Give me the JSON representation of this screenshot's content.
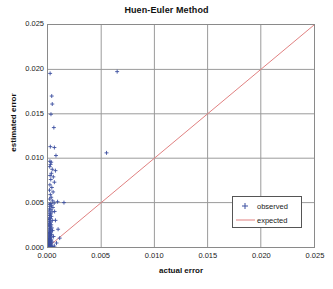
{
  "chart_data": {
    "type": "scatter",
    "title": "Huen-Euler Method",
    "xlabel": "actual error",
    "ylabel": "estimated error",
    "xlim": [
      0.0,
      0.025
    ],
    "ylim": [
      0.0,
      0.025
    ],
    "grid": true,
    "legend_position": "lower-right",
    "xticks": [
      "0.000",
      "0.005",
      "0.010",
      "0.015",
      "0.020",
      "0.025"
    ],
    "yticks": [
      "0.000",
      "0.005",
      "0.010",
      "0.015",
      "0.020",
      "0.025"
    ],
    "xtick_values": [
      0.0,
      0.005,
      0.01,
      0.015,
      0.02,
      0.025
    ],
    "ytick_values": [
      0.0,
      0.005,
      0.01,
      0.015,
      0.02,
      0.025
    ],
    "colors": {
      "observed": "#3b4fa0",
      "expected": "#e08080",
      "grid": "#9a9a9a",
      "frame": "#8a8a8a",
      "background": "#ffffff"
    },
    "series": [
      {
        "name": "observed",
        "type": "scatter",
        "marker": "plus",
        "color": "#3b4fa0",
        "points": [
          [
            0.0002,
            0.01955
          ],
          [
            0.00035,
            0.017
          ],
          [
            0.0004,
            0.0161
          ],
          [
            0.00028,
            0.01495
          ],
          [
            0.00055,
            0.01345
          ],
          [
            0.00022,
            0.0113
          ],
          [
            0.0006,
            0.0112
          ],
          [
            0.00075,
            0.0103
          ],
          [
            0.0055,
            0.0106
          ],
          [
            0.0065,
            0.01975
          ],
          [
            0.00018,
            0.00965
          ],
          [
            0.0003,
            0.00955
          ],
          [
            0.00024,
            0.0093
          ],
          [
            0.00016,
            0.00905
          ],
          [
            0.0004,
            0.00875
          ],
          [
            0.0007,
            0.0086
          ],
          [
            0.00032,
            0.0083
          ],
          [
            0.0002,
            0.00805
          ],
          [
            0.0005,
            0.0079
          ],
          [
            0.00026,
            0.0076
          ],
          [
            0.0006,
            0.0073
          ],
          [
            0.00018,
            0.007
          ],
          [
            0.00036,
            0.0067
          ],
          [
            0.00014,
            0.0064
          ],
          [
            0.00048,
            0.0062
          ],
          [
            0.00022,
            0.0059
          ],
          [
            0.0003,
            0.0056
          ],
          [
            0.00016,
            0.0054
          ],
          [
            0.00044,
            0.0052
          ],
          [
            0.0009,
            0.0051
          ],
          [
            0.0015,
            0.005
          ],
          [
            0.00058,
            0.00495
          ],
          [
            0.00026,
            0.0049
          ],
          [
            0.00012,
            0.0048
          ],
          [
            0.00034,
            0.0047
          ],
          [
            0.0002,
            0.00455
          ],
          [
            0.00046,
            0.00445
          ],
          [
            0.00014,
            0.0043
          ],
          [
            0.00028,
            0.0042
          ],
          [
            0.0001,
            0.00405
          ],
          [
            0.00038,
            0.00395
          ],
          [
            0.00018,
            0.0038
          ],
          [
            0.00024,
            0.0037
          ],
          [
            0.00012,
            0.00355
          ],
          [
            0.00032,
            0.00345
          ],
          [
            0.00016,
            0.0033
          ],
          [
            0.00022,
            0.0032
          ],
          [
            9e-05,
            0.0031
          ],
          [
            0.0004,
            0.003
          ],
          [
            0.00014,
            0.0029
          ],
          [
            0.00026,
            0.0028
          ],
          [
            0.00011,
            0.0027
          ],
          [
            0.00018,
            0.0026
          ],
          [
            0.0003,
            0.0025
          ],
          [
            8e-05,
            0.00245
          ],
          [
            0.00022,
            0.00235
          ],
          [
            0.00013,
            0.00225
          ],
          [
            0.00036,
            0.00215
          ],
          [
            0.00017,
            0.00205
          ],
          [
            0.00025,
            0.002
          ],
          [
            0.0001,
            0.0019
          ],
          [
            0.00043,
            0.00185
          ],
          [
            0.00019,
            0.00178
          ],
          [
            0.00028,
            0.0017
          ],
          [
            0.00012,
            0.00162
          ],
          [
            0.00021,
            0.00155
          ],
          [
            7e-05,
            0.00148
          ],
          [
            0.00033,
            0.00142
          ],
          [
            0.00015,
            0.00135
          ],
          [
            0.00024,
            0.00128
          ],
          [
            9e-05,
            0.0012
          ],
          [
            0.00052,
            0.00118
          ],
          [
            0.00018,
            0.00112
          ],
          [
            0.00027,
            0.00105
          ],
          [
            0.00011,
            0.00098
          ],
          [
            0.0002,
            0.00092
          ],
          [
            6e-05,
            0.00086
          ],
          [
            0.00031,
            0.0008
          ],
          [
            0.00014,
            0.00075
          ],
          [
            0.00023,
            0.0007
          ],
          [
            8e-05,
            0.00065
          ],
          [
            0.00017,
            0.0006
          ],
          [
            0.00038,
            0.00057
          ],
          [
            0.0001,
            0.00052
          ],
          [
            0.00026,
            0.00048
          ],
          [
            0.00013,
            0.00044
          ],
          [
            5e-05,
            0.0004
          ],
          [
            0.00019,
            0.00036
          ],
          [
            0.0003,
            0.00033
          ],
          [
            9e-05,
            0.00029
          ],
          [
            0.00016,
            0.00026
          ],
          [
            0.00022,
            0.00022
          ],
          [
            7e-05,
            0.00019
          ],
          [
            0.00012,
            0.00016
          ],
          [
            4e-05,
            0.00013
          ],
          [
            0.00025,
            0.00012
          ],
          [
            0.00015,
            0.0001
          ],
          [
            8e-05,
            8e-05
          ],
          [
            0.00018,
            7e-05
          ],
          [
            6e-05,
            5e-05
          ],
          [
            0.00011,
            4e-05
          ],
          [
            3e-05,
            3e-05
          ],
          [
            0.00021,
            3e-05
          ],
          [
            0.00013,
            2e-05
          ],
          [
            5e-05,
            2e-05
          ],
          [
            9e-05,
            1e-05
          ],
          [
            0.00016,
            1e-05
          ],
          [
            2e-05,
            1e-05
          ],
          [
            7e-05,
            0.0
          ],
          [
            0.00012,
            0.0
          ],
          [
            0.00028,
            1e-05
          ],
          [
            0.00035,
            2e-05
          ],
          [
            0.00045,
            4e-05
          ],
          [
            0.0006,
            0.0001
          ],
          [
            0.0008,
            0.00045
          ],
          [
            0.0011,
            0.001
          ],
          [
            0.00095,
            0.002
          ],
          [
            0.0007,
            0.003
          ],
          [
            0.00062,
            0.004
          ]
        ]
      },
      {
        "name": "expected",
        "type": "line",
        "color": "#e08080",
        "points": [
          [
            0.0,
            0.0
          ],
          [
            0.025,
            0.025
          ]
        ]
      }
    ],
    "legend": [
      {
        "label": "observed",
        "symbol": "plus-marker",
        "color": "#3b4fa0"
      },
      {
        "label": "expected",
        "symbol": "line-swatch",
        "color": "#e08080"
      }
    ]
  }
}
